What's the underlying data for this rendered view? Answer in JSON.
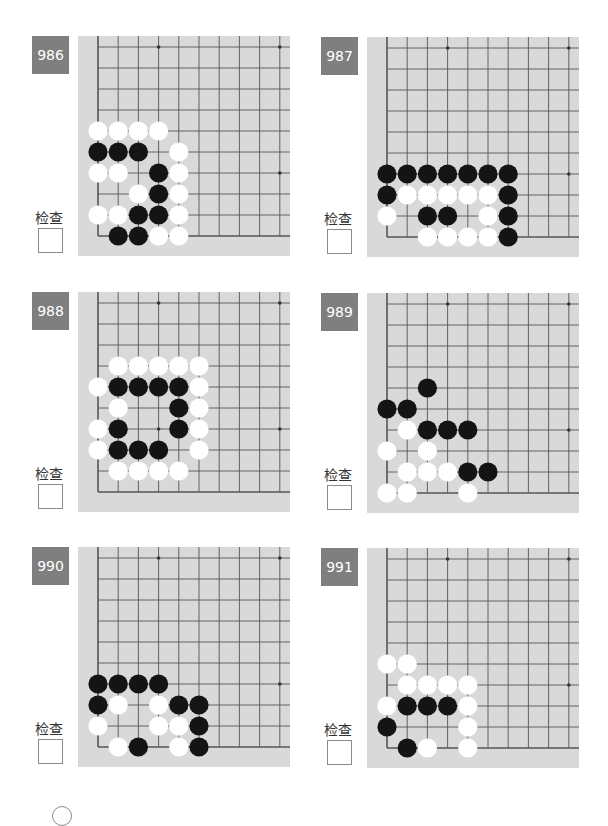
{
  "page": {
    "check_label": "检查"
  },
  "colors": {
    "label_bg": "#7f7f7f",
    "board_bg": "#d9d9d9",
    "grid_line": "#555555",
    "black_stone": "#141414",
    "white_stone": "#ffffff"
  },
  "problems": [
    {
      "number": "986",
      "check_label": "检查",
      "stones": {
        "black": [
          [
            0,
            5
          ],
          [
            1,
            5
          ],
          [
            2,
            5
          ],
          [
            3,
            6
          ],
          [
            3,
            7
          ],
          [
            2,
            8
          ],
          [
            3,
            8
          ],
          [
            1,
            9
          ],
          [
            2,
            9
          ]
        ],
        "white": [
          [
            0,
            4
          ],
          [
            1,
            4
          ],
          [
            2,
            4
          ],
          [
            3,
            4
          ],
          [
            4,
            5
          ],
          [
            0,
            6
          ],
          [
            1,
            6
          ],
          [
            4,
            6
          ],
          [
            2,
            7
          ],
          [
            4,
            7
          ],
          [
            0,
            8
          ],
          [
            1,
            8
          ],
          [
            4,
            8
          ],
          [
            3,
            9
          ],
          [
            4,
            9
          ]
        ]
      }
    },
    {
      "number": "987",
      "check_label": "检查",
      "stones": {
        "black": [
          [
            0,
            6
          ],
          [
            1,
            6
          ],
          [
            2,
            6
          ],
          [
            3,
            6
          ],
          [
            4,
            6
          ],
          [
            5,
            6
          ],
          [
            6,
            6
          ],
          [
            0,
            7
          ],
          [
            6,
            7
          ],
          [
            2,
            8
          ],
          [
            3,
            8
          ],
          [
            6,
            8
          ],
          [
            6,
            9
          ]
        ],
        "white": [
          [
            1,
            7
          ],
          [
            2,
            7
          ],
          [
            3,
            7
          ],
          [
            4,
            7
          ],
          [
            5,
            7
          ],
          [
            0,
            8
          ],
          [
            5,
            8
          ],
          [
            2,
            9
          ],
          [
            3,
            9
          ],
          [
            4,
            9
          ],
          [
            5,
            9
          ]
        ]
      }
    },
    {
      "number": "988",
      "check_label": "检查",
      "stones": {
        "black": [
          [
            1,
            4
          ],
          [
            2,
            4
          ],
          [
            3,
            4
          ],
          [
            4,
            4
          ],
          [
            4,
            5
          ],
          [
            1,
            6
          ],
          [
            4,
            6
          ],
          [
            1,
            7
          ],
          [
            2,
            7
          ],
          [
            3,
            7
          ]
        ],
        "white": [
          [
            1,
            3
          ],
          [
            2,
            3
          ],
          [
            3,
            3
          ],
          [
            4,
            3
          ],
          [
            5,
            3
          ],
          [
            0,
            4
          ],
          [
            5,
            4
          ],
          [
            1,
            5
          ],
          [
            5,
            5
          ],
          [
            0,
            6
          ],
          [
            5,
            6
          ],
          [
            0,
            7
          ],
          [
            5,
            7
          ],
          [
            1,
            8
          ],
          [
            2,
            8
          ],
          [
            3,
            8
          ],
          [
            4,
            8
          ]
        ]
      }
    },
    {
      "number": "989",
      "check_label": "检查",
      "stones": {
        "black": [
          [
            2,
            4
          ],
          [
            0,
            5
          ],
          [
            1,
            5
          ],
          [
            2,
            6
          ],
          [
            3,
            6
          ],
          [
            4,
            6
          ],
          [
            4,
            8
          ],
          [
            5,
            8
          ]
        ],
        "white": [
          [
            1,
            6
          ],
          [
            0,
            7
          ],
          [
            2,
            7
          ],
          [
            1,
            8
          ],
          [
            2,
            8
          ],
          [
            3,
            8
          ],
          [
            0,
            9
          ],
          [
            1,
            9
          ],
          [
            4,
            9
          ]
        ]
      }
    },
    {
      "number": "990",
      "check_label": "检查",
      "stones": {
        "black": [
          [
            0,
            6
          ],
          [
            1,
            6
          ],
          [
            2,
            6
          ],
          [
            3,
            6
          ],
          [
            0,
            7
          ],
          [
            4,
            7
          ],
          [
            5,
            7
          ],
          [
            5,
            8
          ],
          [
            2,
            9
          ],
          [
            5,
            9
          ]
        ],
        "white": [
          [
            1,
            7
          ],
          [
            3,
            7
          ],
          [
            0,
            8
          ],
          [
            3,
            8
          ],
          [
            4,
            8
          ],
          [
            1,
            9
          ],
          [
            4,
            9
          ]
        ]
      }
    },
    {
      "number": "991",
      "check_label": "检查",
      "stones": {
        "black": [
          [
            1,
            7
          ],
          [
            2,
            7
          ],
          [
            3,
            7
          ],
          [
            0,
            8
          ],
          [
            1,
            9
          ]
        ],
        "white": [
          [
            0,
            5
          ],
          [
            1,
            5
          ],
          [
            1,
            6
          ],
          [
            2,
            6
          ],
          [
            3,
            6
          ],
          [
            4,
            6
          ],
          [
            0,
            7
          ],
          [
            4,
            7
          ],
          [
            4,
            8
          ],
          [
            2,
            9
          ],
          [
            4,
            9
          ]
        ]
      }
    }
  ],
  "board_geometry": {
    "columns": 10,
    "rows": 10,
    "star_points": [
      [
        3,
        0
      ],
      [
        9,
        0
      ],
      [
        3,
        6
      ],
      [
        9,
        6
      ]
    ]
  }
}
